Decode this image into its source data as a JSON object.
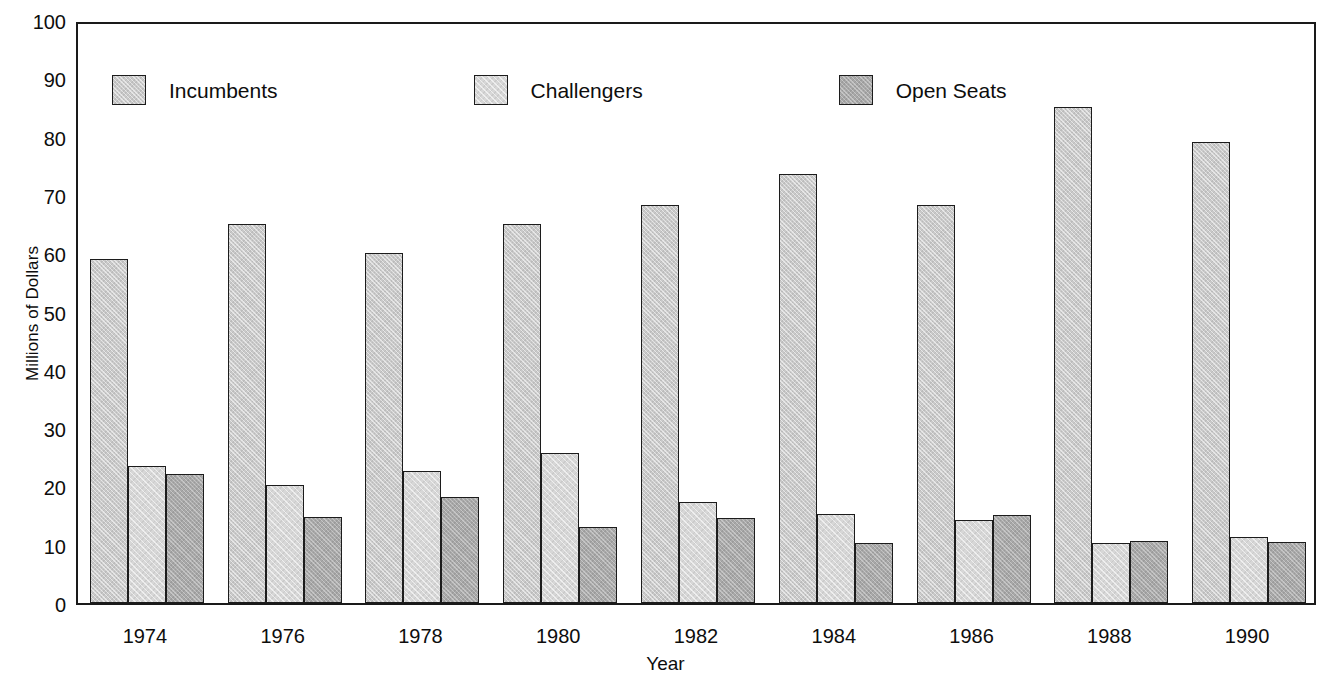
{
  "chart_data": {
    "type": "bar",
    "title": "",
    "subtitle": "",
    "xlabel": "Year",
    "ylabel": "Millions of Dollars",
    "categories": [
      "1974",
      "1976",
      "1978",
      "1980",
      "1982",
      "1984",
      "1986",
      "1988",
      "1990"
    ],
    "series": [
      {
        "name": "Incumbents",
        "color": "#c9c9c9",
        "values": [
          59.0,
          65.0,
          60.0,
          65.0,
          68.3,
          73.6,
          68.3,
          85.0,
          79.0
        ]
      },
      {
        "name": "Challengers",
        "color": "#d7d7d7",
        "values": [
          23.5,
          20.3,
          22.7,
          25.8,
          17.3,
          15.2,
          14.2,
          10.3,
          11.3
        ]
      },
      {
        "name": "Open Seats",
        "color": "#a8a8a8",
        "values": [
          22.1,
          14.8,
          18.2,
          13.0,
          14.5,
          10.3,
          15.1,
          10.7,
          10.4
        ]
      }
    ],
    "ylim": [
      0,
      100
    ],
    "ytick_values": [
      0,
      10,
      20,
      30,
      40,
      50,
      60,
      70,
      80,
      90,
      100
    ],
    "ytick_labels": [
      "0",
      "10",
      "20",
      "30",
      "40",
      "50",
      "60",
      "70",
      "80",
      "90",
      "100"
    ],
    "grid": false,
    "legend_position": "inside-top-left",
    "frame": true,
    "annotations": []
  },
  "axes": {
    "y_title": "Millions of Dollars",
    "x_title": "Year"
  },
  "legend": {
    "items": [
      {
        "label": "Incumbents"
      },
      {
        "label": "Challengers"
      },
      {
        "label": "Open Seats"
      }
    ]
  },
  "colors": {
    "incumbents": "#c9c9c9",
    "challengers": "#d7d7d7",
    "open_seats": "#a8a8a8",
    "axis": "#1a1a1a",
    "text": "#0d0d0d",
    "background": "#ffffff"
  }
}
